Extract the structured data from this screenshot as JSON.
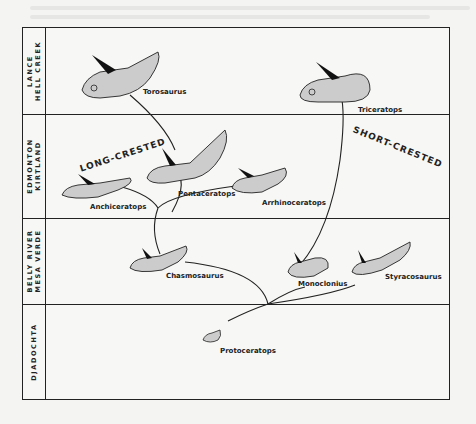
{
  "diagram": {
    "type": "phylogeny"
  },
  "strata": [
    {
      "id": "lance",
      "line1": "LANCE",
      "line2": "HELL CREEK"
    },
    {
      "id": "edmonton",
      "line1": "EDMONTON",
      "line2": "KIRTLAND"
    },
    {
      "id": "bellyriver",
      "line1": "BELLY RIVER",
      "line2": "MESA VERDE"
    },
    {
      "id": "djadochta",
      "line1": "DJADOCHTA",
      "line2": ""
    }
  ],
  "groups": {
    "long": "LONG-CRESTED",
    "short": "SHORT-CRESTED"
  },
  "taxa": {
    "torosaurus": "Torosaurus",
    "triceratops": "Triceratops",
    "anchiceratops": "Anchiceratops",
    "pentaceratops": "Pentaceratops",
    "arrhinoceratops": "Arrhinoceratops",
    "chasmosaurus": "Chasmosaurus",
    "monoclonius": "Monoclonius",
    "styracosaurus": "Styracosaurus",
    "protoceratops": "Protoceratops"
  },
  "colors": {
    "ink": "#222222",
    "paper": "#f7f7f5",
    "shade": "#c9c9c6"
  }
}
